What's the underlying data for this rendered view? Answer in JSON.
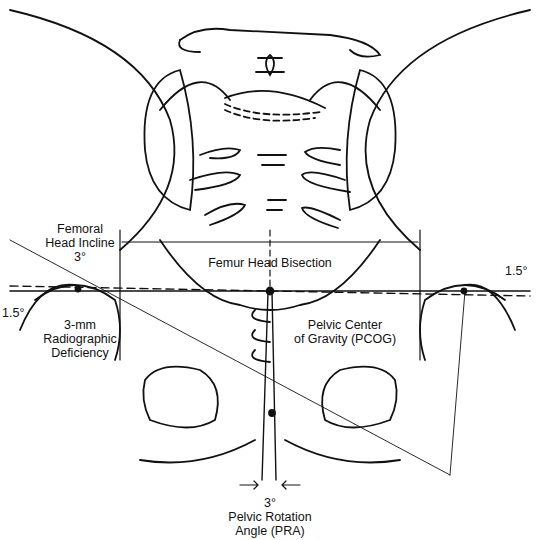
{
  "diagram": {
    "type": "anatomical-line-diagram",
    "labels": {
      "femoral_head_incline_line1": "Femoral",
      "femoral_head_incline_line2": "Head Incline",
      "femoral_head_incline_value": "3°",
      "femur_head_bisection": "Femur Head Bisection",
      "left_angle": "1.5°",
      "right_angle": "1.5°",
      "radiographic_line1": "3-mm",
      "radiographic_line2": "Radiographic",
      "radiographic_line3": "Deficiency",
      "pcog_line1": "Pelvic Center",
      "pcog_line2": "of Gravity (PCOG)",
      "pra_value": "3°",
      "pra_line1": "Pelvic Rotation",
      "pra_line2": "Angle (PRA)"
    },
    "colors": {
      "ink": "#111111",
      "background": "#ffffff"
    }
  }
}
